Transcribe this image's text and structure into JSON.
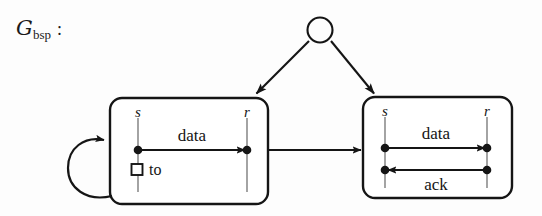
{
  "figure": {
    "name": "bsp-graph-diagram",
    "label": {
      "symbol": "G",
      "subscript": "bsp",
      "colon": ":",
      "full": "G_bsp :"
    },
    "colors": {
      "background": "#fdfdfd",
      "stroke": "#151515",
      "lifeline": "#9a9a9a",
      "box_fill": "#ffffff"
    },
    "root_node": {
      "name": "root-circle-node",
      "shape": "circle",
      "filled": false,
      "cx": 320,
      "cy": 30,
      "r": 13
    },
    "branches": [
      {
        "name": "branch-arrow-left",
        "from": "root-circle-node",
        "to": "left-box",
        "arrowhead": true
      },
      {
        "name": "branch-arrow-right",
        "from": "root-circle-node",
        "to": "right-box",
        "arrowhead": true
      }
    ],
    "transition_arrow": {
      "name": "left-to-right-transition-arrow",
      "from": "left-box",
      "to": "right-box",
      "arrowhead": true
    },
    "self_loop": {
      "name": "left-box-self-loop-arrow",
      "on": "left-box",
      "arrowhead": true
    },
    "boxes": [
      {
        "id": "left-box",
        "name": "left-scenario-box",
        "lifelines": [
          {
            "name": "lifeline-s",
            "label": "s",
            "role": "sender"
          },
          {
            "name": "lifeline-r",
            "label": "r",
            "role": "receiver"
          }
        ],
        "messages": [
          {
            "name": "message-data",
            "label": "data",
            "direction": "left-to-right",
            "label_position": "above"
          }
        ],
        "markers": [
          {
            "name": "timeout-marker",
            "glyph": "square-outline",
            "label": "to"
          }
        ]
      },
      {
        "id": "right-box",
        "name": "right-scenario-box",
        "lifelines": [
          {
            "name": "lifeline-s",
            "label": "s",
            "role": "sender"
          },
          {
            "name": "lifeline-r",
            "label": "r",
            "role": "receiver"
          }
        ],
        "messages": [
          {
            "name": "message-data",
            "label": "data",
            "direction": "left-to-right",
            "label_position": "above"
          },
          {
            "name": "message-ack",
            "label": "ack",
            "direction": "right-to-left",
            "label_position": "below"
          }
        ],
        "markers": []
      }
    ]
  }
}
